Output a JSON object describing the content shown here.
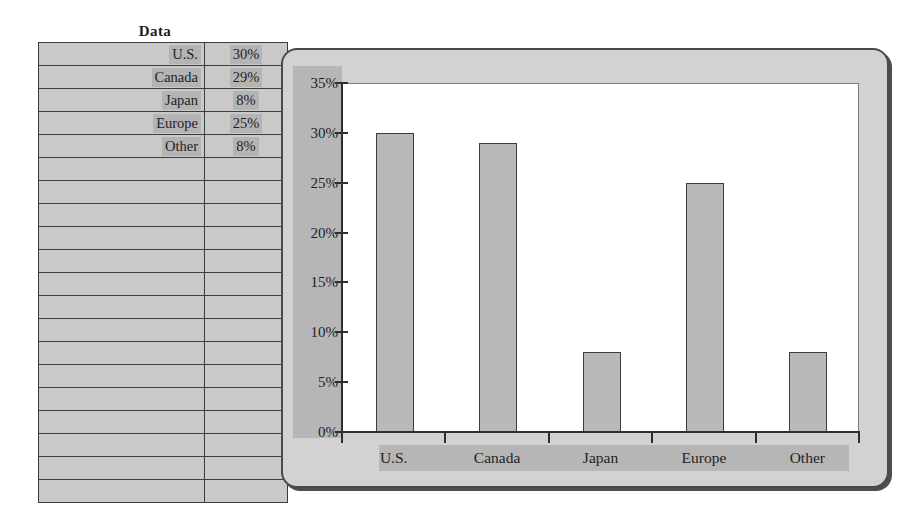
{
  "table": {
    "title": "Data",
    "columns": [
      "",
      ""
    ],
    "rows": [
      {
        "label": "U.S.",
        "value": "30%"
      },
      {
        "label": "Canada",
        "value": "29%"
      },
      {
        "label": "Japan",
        "value": "8%"
      },
      {
        "label": "Europe",
        "value": "25%"
      },
      {
        "label": "Other",
        "value": "8%"
      }
    ],
    "empty_row_count": 15,
    "total_row_count": 20,
    "fill_color": "#c9c9c9",
    "cell_highlight_color": "#b4b4b4",
    "border_color": "#3d3d3d"
  },
  "chart_panel": {
    "frame_color": "#d2d2d2",
    "frame_border_color": "#4a4a4a",
    "axis_band_color": "#b6b6b6",
    "plot_background": "#ffffff",
    "bar_fill": "#b9b9b9",
    "bar_border": "#3c3c3c"
  },
  "chart_data": {
    "type": "bar",
    "title": "",
    "xlabel": "",
    "ylabel": "",
    "categories": [
      "U.S.",
      "Canada",
      "Japan",
      "Europe",
      "Other"
    ],
    "values": [
      30,
      29,
      8,
      25,
      8
    ],
    "value_labels": [
      "30%",
      "29%",
      "8%",
      "25%",
      "8%"
    ],
    "ylim": [
      0,
      35
    ],
    "ytick_values": [
      0,
      5,
      10,
      15,
      20,
      25,
      30,
      35
    ],
    "ytick_labels": [
      "0%",
      "5%",
      "10%",
      "15%",
      "20%",
      "25%",
      "30%",
      "35%"
    ],
    "grid": false,
    "legend": false,
    "legend_position": "none",
    "series": [
      {
        "name": "Data",
        "values": [
          30,
          29,
          8,
          25,
          8
        ]
      }
    ]
  }
}
